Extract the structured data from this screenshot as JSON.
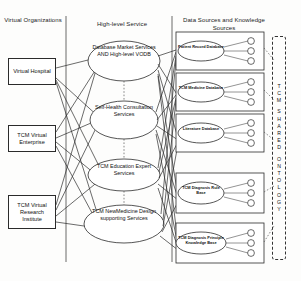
{
  "diagram": {
    "columns": {
      "virtual_organizations": "Virtual Organizations",
      "high_level_service": "High-level Service",
      "data_sources": "Data Sources and Knowledge Sources"
    },
    "virtual_organizations": [
      {
        "id": "vo-virtual-hospital",
        "label": "Virtual Hospital"
      },
      {
        "id": "vo-tcm-enterprise",
        "label": "TCM Virtual Enterprise"
      },
      {
        "id": "vo-tcm-research",
        "label": "TCM Virtual Research Institute"
      }
    ],
    "high_level_services": [
      {
        "id": "svc-database-market",
        "label": "Database Market Services AND High-level VODB"
      },
      {
        "id": "svc-self-health",
        "label": "Self-Health Consultation Services"
      },
      {
        "id": "svc-tcm-education",
        "label": "TCM Education Expert Services"
      },
      {
        "id": "svc-new-medicine",
        "label": "TCM NewMedicine Design supporting Services"
      }
    ],
    "data_sources": [
      {
        "id": "ds-patient-record",
        "label": "Patient Record Database",
        "node_count": 3
      },
      {
        "id": "ds-tcm-medicine",
        "label": "TCM Medicine Database",
        "node_count": 3
      },
      {
        "id": "ds-literature",
        "label": "Literature Database",
        "node_count": 3
      },
      {
        "id": "ds-diagnosis-rule",
        "label": "TCM Diagnosis Rule Base",
        "node_count": 3
      },
      {
        "id": "ds-diagnosis-principle",
        "label": "TCM Diagnosis Principle Knowledge Base",
        "node_count": 3
      }
    ],
    "ontology": {
      "label": "TCM SHARED ONTOLOGY",
      "characters": [
        "T",
        "C",
        "M",
        "",
        "S",
        "H",
        "A",
        "R",
        "E",
        "D",
        "",
        "O",
        "N",
        "T",
        "O",
        "L",
        "O",
        "G",
        "Y"
      ]
    },
    "colors": {
      "stroke": "#2b2b2b",
      "fill": "#ffffff",
      "background": "#fdfdfc",
      "dashed": "#333333"
    }
  }
}
